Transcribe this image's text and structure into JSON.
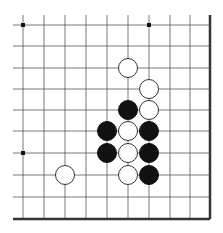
{
  "board": {
    "type": "go-board-corner-diagram",
    "columns_x": [
      23,
      44,
      65,
      86,
      107,
      128,
      149,
      170,
      190,
      210
    ],
    "rows_y": [
      25,
      46,
      68,
      89,
      110,
      131,
      153,
      175,
      197,
      219
    ],
    "open_extent": {
      "left": 13,
      "top": 15
    },
    "closed_edges": [
      "right",
      "bottom"
    ],
    "line_color": "#555555",
    "edge_color": "#333333",
    "star_points": [
      {
        "col": 0,
        "row": 0
      },
      {
        "col": 6,
        "row": 0
      },
      {
        "col": 0,
        "row": 6
      }
    ],
    "stone_diameter": 20,
    "stones": [
      {
        "color": "white",
        "col": 5,
        "row": 2
      },
      {
        "color": "white",
        "col": 6,
        "row": 3
      },
      {
        "color": "black",
        "col": 5,
        "row": 4
      },
      {
        "color": "white",
        "col": 6,
        "row": 4
      },
      {
        "color": "black",
        "col": 4,
        "row": 5
      },
      {
        "color": "white",
        "col": 5,
        "row": 5
      },
      {
        "color": "black",
        "col": 6,
        "row": 5
      },
      {
        "color": "black",
        "col": 4,
        "row": 6
      },
      {
        "color": "white",
        "col": 5,
        "row": 6
      },
      {
        "color": "black",
        "col": 6,
        "row": 6
      },
      {
        "color": "white",
        "col": 5,
        "row": 7
      },
      {
        "color": "black",
        "col": 6,
        "row": 7
      },
      {
        "color": "white",
        "col": 2,
        "row": 7
      }
    ]
  }
}
